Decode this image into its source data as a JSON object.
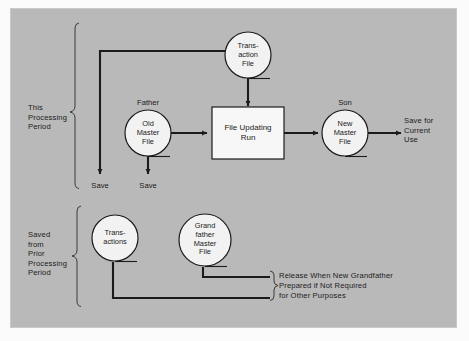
{
  "diagram": {
    "background_color": "#b9b9b9",
    "node_fill": "#f2f2f2",
    "line_color": "#1b1b1b",
    "groups": [
      {
        "id": "this-period",
        "label": "This\nProcessing\nPeriod"
      },
      {
        "id": "prior-period",
        "label": "Saved\nfrom\nPrior\nProcessing\nPeriod"
      }
    ],
    "nodes": [
      {
        "id": "transaction-file",
        "shape": "tape",
        "label": "Trans-\naction\nFile",
        "caption": ""
      },
      {
        "id": "old-master-file",
        "shape": "tape",
        "label": "Old\nMaster\nFile",
        "caption": "Father"
      },
      {
        "id": "file-updating-run",
        "shape": "process",
        "label": "File Updating\nRun",
        "caption": ""
      },
      {
        "id": "new-master-file",
        "shape": "tape",
        "label": "New\nMaster\nFile",
        "caption": "Son"
      },
      {
        "id": "transactions",
        "shape": "tape",
        "label": "Trans-\nactions",
        "caption": ""
      },
      {
        "id": "grandfather-master-file",
        "shape": "tape",
        "label": "Grand\nfather\nMaster\nFile",
        "caption": ""
      }
    ],
    "annotations": [
      {
        "id": "save-transactions",
        "text": "Save"
      },
      {
        "id": "save-old-master",
        "text": "Save"
      },
      {
        "id": "save-current-use",
        "text": "Save for\nCurrent\nUse"
      },
      {
        "id": "release-note",
        "text": "Release When New Grandfather\nPrepared if Not Required\nfor Other Purposes"
      }
    ]
  }
}
